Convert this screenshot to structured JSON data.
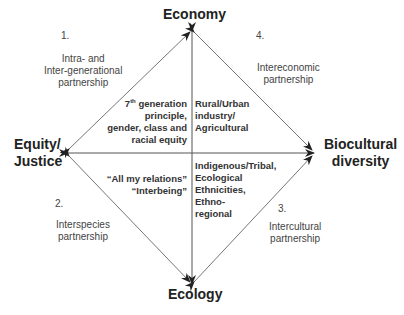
{
  "vertices": {
    "top": "Economy",
    "bottom": "Ecology",
    "left_line1": "Equity/",
    "left_line2": "Justice",
    "right_line1": "Biocultural",
    "right_line2": "diversity"
  },
  "partnerships": [
    {
      "number": "1.",
      "line1": "Intra- and",
      "line2": "Inter-generational",
      "line3": "partnership"
    },
    {
      "number": "2.",
      "line1": "Interspecies",
      "line2": "partnership"
    },
    {
      "number": "3.",
      "line1": "Intercultural",
      "line2": "partnership"
    },
    {
      "number": "4.",
      "line1": "Intereconomic",
      "line2": "partnership"
    }
  ],
  "quadrants": {
    "upper_left": {
      "line1_num": "7",
      "line1_sup": "th",
      "line1_rest": " generation",
      "line2": "principle,",
      "line3": "gender, class and",
      "line4": "racial equity"
    },
    "upper_right": {
      "line1": "Rural/Urban",
      "line2": "industry/",
      "line3": "Agricultural"
    },
    "lower_left": {
      "line1": "“All my relations”",
      "line2": "“Interbeing”"
    },
    "lower_right": {
      "line1": "Indigenous/Tribal,",
      "line2": "Ecological",
      "line3": "Ethnicities,",
      "line4": "Ethno-",
      "line5": "regional"
    }
  },
  "colors": {
    "line": "#555555",
    "arrow": "#222222",
    "text": "#333333"
  }
}
